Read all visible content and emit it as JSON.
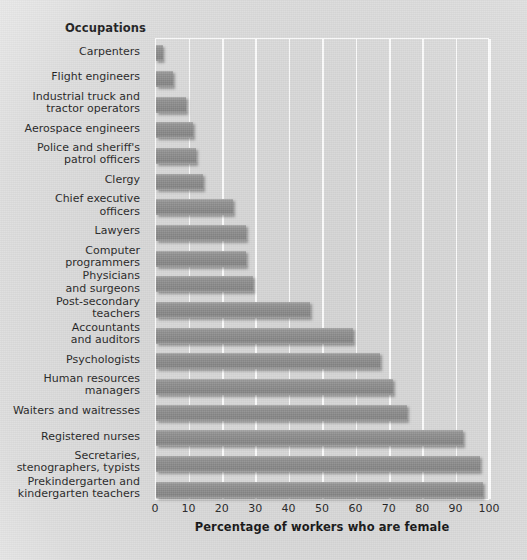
{
  "chart_data": {
    "type": "bar",
    "orientation": "horizontal",
    "title": "",
    "category_header": "Occupations",
    "xlabel": "Percentage of workers who are female",
    "ylabel": "Occupations",
    "xlim": [
      0,
      100
    ],
    "xticks": [
      0,
      10,
      20,
      30,
      40,
      50,
      60,
      70,
      80,
      90,
      100
    ],
    "xtick_labels": [
      "0",
      "10",
      "20",
      "30",
      "40",
      "50",
      "60",
      "70",
      "80",
      "90",
      "100"
    ],
    "grid": true,
    "grid_axis": "x",
    "grid_color": "#fbfbfb",
    "legend": false,
    "bar_color": "#8a8a8a",
    "background_color": "#d8d8d8",
    "categories": [
      "Carpenters",
      "Flight engineers",
      "Industrial truck and\ntractor operators",
      "Aerospace engineers",
      "Police and sheriff's\npatrol officers",
      "Clergy",
      "Chief executive\nofficers",
      "Lawyers",
      "Computer\nprogrammers",
      "Physicians\nand surgeons",
      "Post-secondary\nteachers",
      "Accountants\nand auditors",
      "Psychologists",
      "Human resources\nmanagers",
      "Waiters and waitresses",
      "Registered nurses",
      "Secretaries,\nstenographers, typists",
      "Prekindergarten and\nkindergarten teachers"
    ],
    "values": [
      2,
      5,
      9,
      11,
      12,
      14,
      23,
      27,
      27,
      29,
      46,
      59,
      67,
      71,
      75,
      92,
      97,
      98
    ]
  },
  "axis": {
    "x_title": "Percentage of workers who are female"
  }
}
